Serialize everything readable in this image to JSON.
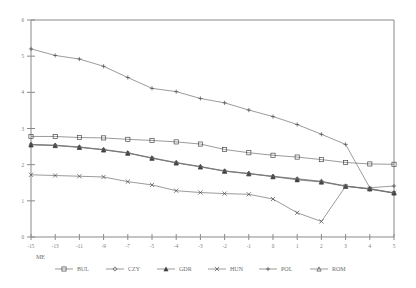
{
  "chart_data": {
    "type": "line",
    "title": "",
    "xlabel": "ME",
    "ylabel": "",
    "xlim": [
      -15,
      5
    ],
    "ylim": [
      0,
      6
    ],
    "grid": false,
    "legend_position": "bottom",
    "x_ticks": [
      "-15",
      "-13",
      "-11",
      "-9",
      "-7",
      "-5",
      "-4",
      "-3",
      "-2",
      "-1",
      "0",
      "1",
      "2",
      "3",
      "4",
      "5"
    ],
    "y_ticks": [
      "0",
      "1",
      "2",
      "3",
      "4",
      "5",
      "6"
    ],
    "x": [
      -15,
      -13,
      -11,
      -9,
      -7,
      -5,
      -4,
      -3,
      -2,
      -1,
      0,
      1,
      2,
      3,
      4,
      5
    ],
    "series": [
      {
        "name": "BUL",
        "marker": "square",
        "values": [
          2.78,
          2.78,
          2.75,
          2.74,
          2.7,
          2.67,
          2.63,
          2.57,
          2.42,
          2.33,
          2.26,
          2.21,
          2.14,
          2.06,
          2.02,
          2.01
        ]
      },
      {
        "name": "CZY",
        "marker": "diamond",
        "values": [
          2.56,
          2.54,
          2.49,
          2.42,
          2.33,
          2.19,
          2.06,
          1.95,
          1.83,
          1.76,
          1.68,
          1.61,
          1.54,
          1.41,
          1.32,
          1.21
        ]
      },
      {
        "name": "GDR",
        "marker": "triangle",
        "values": [
          2.55,
          2.53,
          2.48,
          2.41,
          2.32,
          2.18,
          2.05,
          1.94,
          1.82,
          1.75,
          1.67,
          1.58,
          1.52,
          1.4,
          1.33,
          1.22
        ]
      },
      {
        "name": "HUN",
        "marker": "cross",
        "values": [
          1.72,
          1.7,
          1.68,
          1.66,
          1.53,
          1.44,
          1.28,
          1.23,
          1.2,
          1.18,
          1.05,
          0.67,
          0.43,
          1.4,
          1.33,
          1.22
        ]
      },
      {
        "name": "POL",
        "marker": "plus",
        "values": [
          5.2,
          5.02,
          4.92,
          4.72,
          4.41,
          4.11,
          4.02,
          3.83,
          3.71,
          3.51,
          3.33,
          3.11,
          2.84,
          2.56,
          1.36,
          1.41
        ]
      },
      {
        "name": "ROM",
        "marker": "triangle-up",
        "values": [
          2.55,
          2.53,
          2.48,
          2.41,
          2.32,
          2.18,
          2.05,
          1.94,
          1.82,
          1.75,
          1.67,
          1.6,
          1.53,
          1.41,
          1.34,
          1.22
        ]
      }
    ]
  },
  "legend": {
    "items": [
      {
        "label": "BUL",
        "marker": "square"
      },
      {
        "label": "CZY",
        "marker": "diamond"
      },
      {
        "label": "GDR",
        "marker": "triangle"
      },
      {
        "label": "HUN",
        "marker": "cross"
      },
      {
        "label": "POL",
        "marker": "plus"
      },
      {
        "label": "ROM",
        "marker": "triangle-up"
      }
    ]
  },
  "colors": {
    "axis": "#8a8a8a",
    "line": "#707070",
    "marker": "#4a4a4a",
    "text": "#6d6d6d",
    "background": "#ffffff"
  }
}
